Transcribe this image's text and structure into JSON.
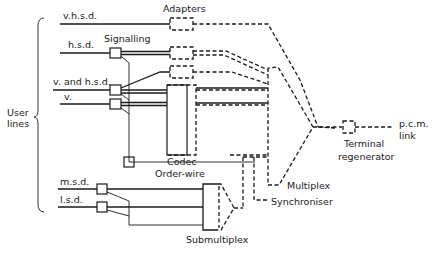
{
  "diagram": {
    "group_label": [
      "User",
      "lines"
    ],
    "inputs": [
      {
        "id": "vhsd",
        "label": "v.h.s.d."
      },
      {
        "id": "hsd",
        "label": "h.s.d."
      },
      {
        "id": "vhsd2",
        "label": "v. and h.s.d."
      },
      {
        "id": "v",
        "label": "v."
      },
      {
        "id": "msd",
        "label": "m.s.d."
      },
      {
        "id": "lsd",
        "label": "l.s.d."
      }
    ],
    "blocks": {
      "adapters": "Adapters",
      "signalling": "Signalling",
      "codec": "Codec",
      "order_wire": "Order-wire",
      "multiplex": "Multiplex",
      "synchroniser": "Synchroniser",
      "submultiplex": "Submultiplex",
      "terminal_regenerator": [
        "Terminal",
        "regenerator"
      ],
      "output": [
        "p.c.m.",
        "link"
      ]
    }
  }
}
